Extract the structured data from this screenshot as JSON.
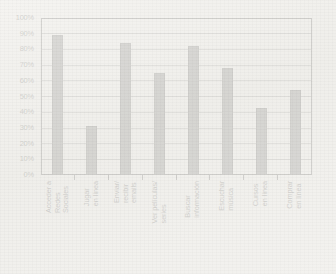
{
  "chart_data": {
    "type": "bar",
    "title": "",
    "subtitle": "",
    "xlabel": "",
    "ylabel": "",
    "ylim": [
      0,
      100
    ],
    "y_tick_labels": [
      "100%",
      "90%",
      "80%",
      "70%",
      "60%",
      "50%",
      "40%",
      "30%",
      "20%",
      "10%",
      "0%"
    ],
    "y_tick_values": [
      100,
      90,
      80,
      70,
      60,
      50,
      40,
      30,
      20,
      10,
      0
    ],
    "grid": true,
    "grid_axis": "y",
    "legend": false,
    "legend_position": "none",
    "value_suffix": "%",
    "bar_color": "#474747",
    "bar_edge_color": "#262626",
    "axis_color": "#1e1e1e",
    "grid_color": "#8c8c8c",
    "background_color": "#f2f1ee",
    "categories": [
      "Acceder a Redes Sociales",
      "Jugar en línea",
      "Enviar/ recibir emails",
      "Ver películas/ series",
      "Buscar información",
      "Escuchar música",
      "Cursos en línea",
      "Comprar en línea"
    ],
    "category_lines": [
      [
        "Acceder a",
        "Redes",
        "Sociales"
      ],
      [
        "Jugar",
        "en línea"
      ],
      [
        "Enviar/",
        "recibir",
        "emails"
      ],
      [
        "Ver películas/",
        "series"
      ],
      [
        "Buscar",
        "información"
      ],
      [
        "Escuchar",
        "música"
      ],
      [
        "Cursos",
        "en línea"
      ],
      [
        "Comprar",
        "en línea"
      ]
    ],
    "values": [
      89,
      31,
      84,
      65,
      82,
      68,
      43,
      54
    ]
  }
}
